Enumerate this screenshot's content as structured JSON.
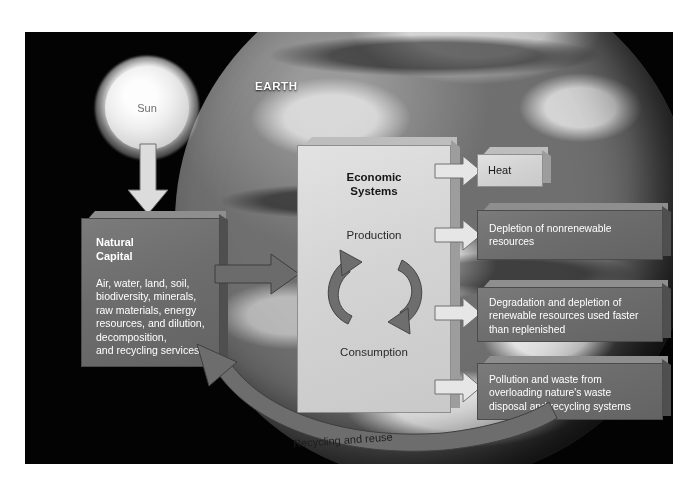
{
  "diagram": {
    "background_color": "#030303",
    "earth": {
      "label": "EARTH"
    },
    "sun": {
      "label": "Sun"
    },
    "natural_capital": {
      "title_line1": "Natural",
      "title_line2": "Capital",
      "body_line1": "Air, water, land, soil,",
      "body_line2": "biodiversity, minerals,",
      "body_line3": "raw materials, energy",
      "body_line4": "resources, and dilution,",
      "body_line5": "decomposition,",
      "body_line6": "and recycling services",
      "fill_color": "#6d6d6d",
      "text_color": "#ffffff"
    },
    "economic_systems": {
      "title_line1": "Economic",
      "title_line2": "Systems",
      "production_label": "Production",
      "consumption_label": "Consumption",
      "fill_color": "#d4d4d4",
      "text_color": "#151515"
    },
    "outputs": [
      {
        "name": "heat",
        "lines": [
          "Heat"
        ],
        "style": "light",
        "fill_color": "#d4d4d4",
        "text_color": "#1a1a1a"
      },
      {
        "name": "depletion",
        "lines": [
          "Depletion of nonrenewable",
          "resources"
        ],
        "style": "dark",
        "fill_color": "#6d6d6d",
        "text_color": "#ffffff"
      },
      {
        "name": "degradation",
        "lines": [
          "Degradation and  depletion of",
          "renewable resources used faster",
          "than replenished"
        ],
        "style": "dark",
        "fill_color": "#6d6d6d",
        "text_color": "#ffffff"
      },
      {
        "name": "pollution",
        "lines": [
          "Pollution and waste from",
          "overloading  nature's waste",
          "disposal  and recycling systems"
        ],
        "style": "dark",
        "fill_color": "#6d6d6d",
        "text_color": "#ffffff"
      }
    ],
    "recycling_arc": {
      "label": "Recycling and reuse"
    }
  }
}
